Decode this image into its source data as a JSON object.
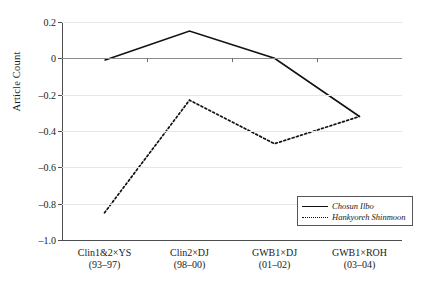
{
  "chart_data": {
    "type": "line",
    "title": "",
    "xlabel": "",
    "ylabel": "Article Count",
    "categories": [
      "Clin1&2×YS\n(93–97)",
      "Clin2×DJ\n(98–00)",
      "GWB1×DJ\n(01–02)",
      "GWB1×ROH\n(03–04)"
    ],
    "category_labels": [
      {
        "line1": "Clin1&2×YS",
        "line2": "(93–97)"
      },
      {
        "line1": "Clin2×DJ",
        "line2": "(98–00)"
      },
      {
        "line1": "GWB1×DJ",
        "line2": "(01–02)"
      },
      {
        "line1": "GWB1×ROH",
        "line2": "(03–04)"
      }
    ],
    "series": [
      {
        "name": "Chosun Ilbo",
        "style": "solid",
        "color": "#111111",
        "values": [
          -0.01,
          0.15,
          0.0,
          -0.32
        ]
      },
      {
        "name": "Hankyoreh Shinmoon",
        "style": "dotted",
        "color": "#111111",
        "values": [
          -0.85,
          -0.23,
          -0.47,
          -0.32
        ]
      }
    ],
    "ylim": [
      -1.0,
      0.2
    ],
    "yticks": [
      0.2,
      0,
      -0.2,
      -0.4,
      -0.6,
      -0.8,
      -1.0
    ],
    "ytick_labels": [
      "0.2",
      "0",
      "–0.2",
      "–0.4",
      "–0.6",
      "–0.8",
      "–1.0"
    ],
    "grid": true,
    "legend_position": "lower-right"
  },
  "legend": {
    "entries": [
      {
        "label": "Chosun Ilbo",
        "style": "solid"
      },
      {
        "label": "Hankyoreh Shinmoon",
        "style": "dotted"
      }
    ]
  }
}
